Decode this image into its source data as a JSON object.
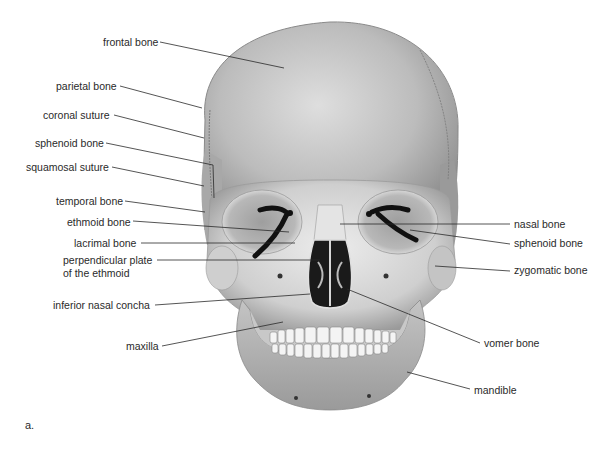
{
  "figure": {
    "panel_label": "a.",
    "colors": {
      "bone": "#bdbdbd",
      "bone_light": "#e6e6e6",
      "bone_dark": "#8a8a8a",
      "cavity": "#1a1a1a",
      "leader_line": "#2a2a2a",
      "text": "#2a2a2a",
      "background": "#ffffff"
    }
  },
  "labels_left": [
    {
      "id": "frontal-bone",
      "text": "frontal bone",
      "x": 103,
      "y": 36
    },
    {
      "id": "parietal-bone",
      "text": "parietal bone",
      "x": 56,
      "y": 80
    },
    {
      "id": "coronal-suture",
      "text": "coronal suture",
      "x": 43,
      "y": 109
    },
    {
      "id": "sphenoid-bone-left",
      "text": "sphenoid bone",
      "x": 35,
      "y": 137
    },
    {
      "id": "squamosal-suture",
      "text": "squamosal suture",
      "x": 26,
      "y": 161
    },
    {
      "id": "temporal-bone",
      "text": "temporal bone",
      "x": 56,
      "y": 195
    },
    {
      "id": "ethmoid-bone",
      "text": "ethmoid bone",
      "x": 67,
      "y": 216
    },
    {
      "id": "lacrimal-bone",
      "text": "lacrimal bone",
      "x": 74,
      "y": 237
    },
    {
      "id": "perpendicular-plate-line1",
      "text": "perpendicular plate",
      "x": 63,
      "y": 254
    },
    {
      "id": "perpendicular-plate-line2",
      "text": "of the ethmoid",
      "x": 63,
      "y": 267
    },
    {
      "id": "inferior-nasal-concha",
      "text": "inferior nasal concha",
      "x": 53,
      "y": 299
    },
    {
      "id": "maxilla",
      "text": "maxilla",
      "x": 126,
      "y": 340
    }
  ],
  "labels_right": [
    {
      "id": "nasal-bone",
      "text": "nasal bone",
      "x": 514,
      "y": 221
    },
    {
      "id": "sphenoid-bone-right",
      "text": "sphenoid bone",
      "x": 514,
      "y": 240
    },
    {
      "id": "zygomatic-bone",
      "text": "zygomatic bone",
      "x": 514,
      "y": 267
    },
    {
      "id": "vomer-bone",
      "text": "vomer bone",
      "x": 484,
      "y": 338
    },
    {
      "id": "mandible",
      "text": "mandible",
      "x": 474,
      "y": 384
    }
  ],
  "leader_lines": [
    {
      "for": "frontal-bone",
      "x1": 160,
      "y1": 42,
      "x2": 284,
      "y2": 68
    },
    {
      "for": "parietal-bone",
      "x1": 120,
      "y1": 86,
      "x2": 202,
      "y2": 108
    },
    {
      "for": "coronal-suture",
      "x1": 114,
      "y1": 115,
      "x2": 204,
      "y2": 138
    },
    {
      "for": "sphenoid-bone-left",
      "x1": 106,
      "y1": 143,
      "x2": 213,
      "y2": 165,
      "x3": 214,
      "y3": 198
    },
    {
      "for": "squamosal-suture",
      "x1": 112,
      "y1": 167,
      "x2": 204,
      "y2": 186
    },
    {
      "for": "temporal-bone",
      "x1": 125,
      "y1": 201,
      "x2": 205,
      "y2": 212
    },
    {
      "for": "ethmoid-bone",
      "x1": 133,
      "y1": 221,
      "x2": 289,
      "y2": 232
    },
    {
      "for": "lacrimal-bone",
      "x1": 141,
      "y1": 243,
      "x2": 295,
      "y2": 243
    },
    {
      "for": "perpendicular-plate",
      "x1": 157,
      "y1": 260,
      "x2": 320,
      "y2": 260
    },
    {
      "for": "inferior-nasal-concha",
      "x1": 155,
      "y1": 305,
      "x2": 310,
      "y2": 294
    },
    {
      "for": "maxilla",
      "x1": 162,
      "y1": 346,
      "x2": 283,
      "y2": 322
    },
    {
      "for": "nasal-bone",
      "x1": 340,
      "y1": 224,
      "x2": 510,
      "y2": 224
    },
    {
      "for": "sphenoid-bone-right",
      "x1": 410,
      "y1": 230,
      "x2": 510,
      "y2": 244
    },
    {
      "for": "zygomatic-bone",
      "x1": 435,
      "y1": 266,
      "x2": 510,
      "y2": 271
    },
    {
      "for": "vomer-bone",
      "x1": 347,
      "y1": 289,
      "x2": 480,
      "y2": 343
    },
    {
      "for": "mandible",
      "x1": 407,
      "y1": 372,
      "x2": 470,
      "y2": 389
    }
  ]
}
